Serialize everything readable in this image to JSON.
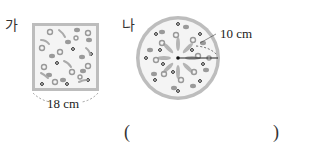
{
  "problem": {
    "top_text_cropped": "· · · · · · · · · · · ·",
    "figures": [
      {
        "label": "가",
        "shape": "square",
        "dimension": "18 cm"
      },
      {
        "label": "나",
        "shape": "circle",
        "dimension": "10 cm"
      }
    ],
    "answer_open": "(",
    "answer_close": ")"
  }
}
